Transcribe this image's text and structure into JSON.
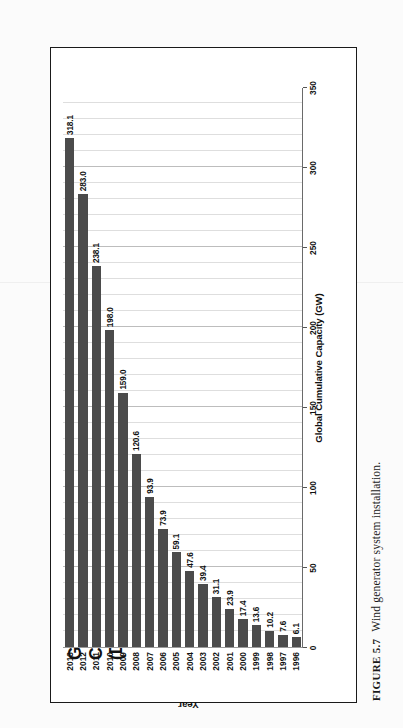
{
  "caption": {
    "label": "FIGURE 5.7",
    "text": "Wind generator system installation."
  },
  "chart_data": {
    "type": "bar",
    "orientation": "vertical",
    "title": "Global Wind Power Cumulative Capacity",
    "subtitle": "(Data: GWEC)",
    "title_line1": "Global Wind Power Cumulative Capacity",
    "title_line2": "(Data: GWEC)",
    "xlabel": "Year",
    "ylabel": "Global Cumulative Capacity (GW)",
    "ylim": [
      0,
      350
    ],
    "yticks": [
      "0",
      "50",
      "100",
      "150",
      "200",
      "250",
      "300",
      "350"
    ],
    "ytick_values": [
      0,
      50,
      100,
      150,
      200,
      250,
      300,
      350
    ],
    "grid": true,
    "grid_minor_step": 10,
    "legend": "none",
    "bar_color": "#4b4b4b",
    "categories": [
      "1996",
      "1997",
      "1998",
      "1999",
      "2000",
      "2001",
      "2002",
      "2003",
      "2004",
      "2005",
      "2006",
      "2007",
      "2008",
      "2009",
      "2010",
      "2011",
      "2012",
      "2013"
    ],
    "values": [
      6.1,
      7.6,
      10.2,
      13.6,
      17.4,
      23.9,
      31.1,
      39.4,
      47.6,
      59.1,
      73.9,
      93.9,
      120.6,
      159.0,
      198.0,
      238.1,
      283.0,
      318.1
    ],
    "data_labels": [
      "6.1",
      "7.6",
      "10.2",
      "13.6",
      "17.4",
      "23.9",
      "31.1",
      "39.4",
      "47.6",
      "59.1",
      "73.9",
      "93.9",
      "120.6",
      "159.0",
      "198.0",
      "238.1",
      "283.0",
      "318.1"
    ]
  }
}
